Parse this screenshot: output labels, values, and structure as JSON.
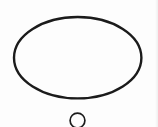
{
  "canvas": {
    "width": 158,
    "height": 127,
    "background": "#fdfdfd",
    "stroke_color": "#1b1b1b"
  },
  "shapes": [
    {
      "type": "ellipse",
      "name": "large-ellipse-outline",
      "cx": 77.7,
      "cy": 57.7,
      "rx": 63.7,
      "ry": 40.7,
      "fill": "none",
      "stroke": "#1b1b1b",
      "stroke_width": 2.4
    },
    {
      "type": "circle",
      "name": "small-circle-outline",
      "cx": 77.5,
      "cy": 120.5,
      "r": 7.4,
      "fill": "none",
      "stroke": "#1b1b1b",
      "stroke_width": 1.7
    }
  ]
}
